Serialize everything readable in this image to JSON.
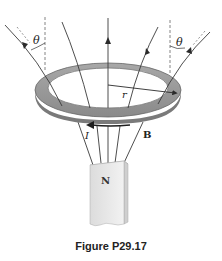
{
  "figure": {
    "caption": "Figure P29.17",
    "labels": {
      "theta_left": "θ",
      "theta_right": "θ",
      "radius": "r",
      "current": "I",
      "field": "B",
      "magnet_pole": "N"
    },
    "colors": {
      "ring_top": "#9a9a9a",
      "ring_inner": "#d9d9d9",
      "ring_edge": "#6e6e6e",
      "field_line": "#3a3a3a",
      "magnet_front": "#ececec",
      "magnet_side": "#d6d6d6",
      "magnet_top": "#b5b5b5"
    }
  }
}
